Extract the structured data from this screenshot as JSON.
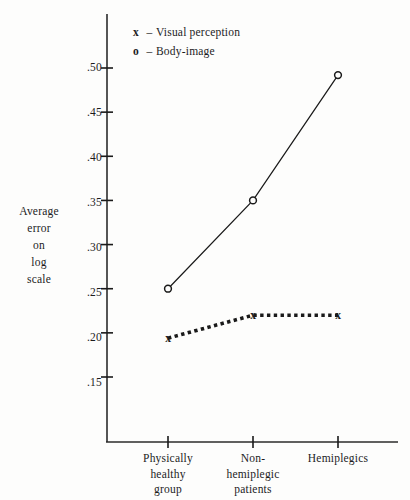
{
  "chart_data": {
    "type": "line",
    "title": "",
    "xlabel": "",
    "ylabel": "Average error on log scale",
    "ylabel_lines": [
      "Average",
      "error",
      "on",
      "log",
      "scale"
    ],
    "categories": [
      "Physically healthy group",
      "Non-hemiplegic patients",
      "Hemiplegics"
    ],
    "category_lines": [
      [
        "Physically",
        "healthy",
        "group"
      ],
      [
        "Non-",
        "hemiplegic",
        "patients"
      ],
      [
        "Hemiplegics"
      ]
    ],
    "series": [
      {
        "name": "Visual perception",
        "marker": "x",
        "linestyle": "dotted",
        "values": [
          0.194,
          0.22,
          0.22
        ]
      },
      {
        "name": "Body-image",
        "marker": "o",
        "linestyle": "solid",
        "values": [
          0.25,
          0.35,
          0.492
        ]
      }
    ],
    "ytick_labels": [
      ".50",
      ".45",
      ".40",
      ".35",
      ".30",
      ".25",
      ".20",
      ".15"
    ],
    "ytick_values": [
      0.5,
      0.45,
      0.4,
      0.35,
      0.3,
      0.25,
      0.2,
      0.15
    ],
    "ylim": [
      0.15,
      0.5
    ],
    "grid": false,
    "legend_position": "top-left-inside",
    "legend": [
      {
        "marker": "x",
        "dash": "–",
        "label": "Visual perception"
      },
      {
        "marker": "o",
        "dash": "–",
        "label": "Body-image"
      }
    ]
  },
  "style": {
    "ink": "#1a1a1a",
    "axis": "#2b2b2b",
    "background": "#fdfdfc"
  }
}
